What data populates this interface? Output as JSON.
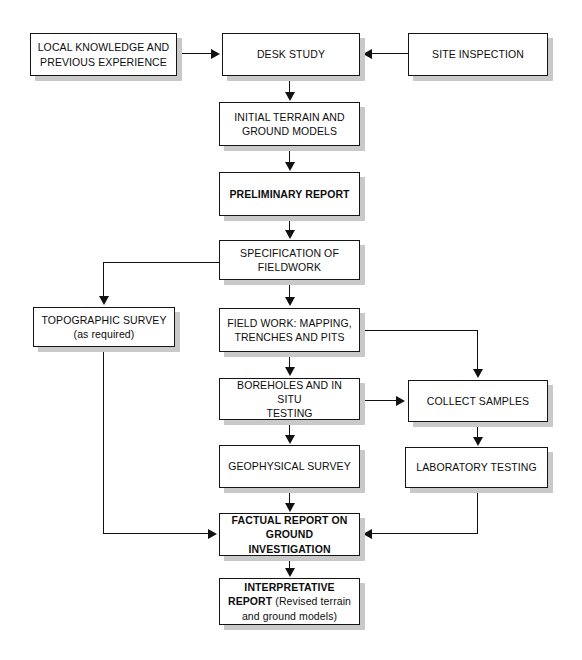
{
  "diagram": {
    "colors": {
      "box_fill": "#ffffff",
      "box_border": "#151515",
      "box_shadow": "#c9c9c9",
      "connector": "#111111",
      "background": "#ffffff"
    },
    "nodes": [
      {
        "id": "local-knowledge",
        "lines": [
          "LOCAL KNOWLEDGE AND",
          "PREVIOUS EXPERIENCE"
        ],
        "bold": false
      },
      {
        "id": "desk-study",
        "lines": [
          "DESK STUDY"
        ],
        "bold": false
      },
      {
        "id": "site-inspection",
        "lines": [
          "SITE INSPECTION"
        ],
        "bold": false
      },
      {
        "id": "initial-terrain",
        "lines": [
          "INITIAL TERRAIN AND",
          "GROUND MODELS"
        ],
        "bold": false
      },
      {
        "id": "preliminary-report",
        "lines": [
          "PRELIMINARY REPORT"
        ],
        "bold": true
      },
      {
        "id": "specification-fieldwork",
        "lines": [
          "SPECIFICATION OF",
          "FIELDWORK"
        ],
        "bold": false
      },
      {
        "id": "topographic-survey",
        "lines": [
          "TOPOGRAPHIC SURVEY",
          "(as required)"
        ],
        "bold": false
      },
      {
        "id": "field-work",
        "lines": [
          "FIELD WORK: MAPPING,",
          "TRENCHES AND PITS"
        ],
        "bold": false
      },
      {
        "id": "boreholes",
        "lines": [
          "BOREHOLES AND IN SITU",
          "TESTING"
        ],
        "bold": false
      },
      {
        "id": "collect-samples",
        "lines": [
          "COLLECT SAMPLES"
        ],
        "bold": false
      },
      {
        "id": "geophysical-survey",
        "lines": [
          "GEOPHYSICAL SURVEY"
        ],
        "bold": false
      },
      {
        "id": "laboratory-testing",
        "lines": [
          "LABORATORY TESTING"
        ],
        "bold": false
      },
      {
        "id": "factual-report",
        "lines": [
          "FACTUAL REPORT ON",
          "GROUND INVESTIGATION"
        ],
        "bold": true
      },
      {
        "id": "interpretative-report",
        "lines": [
          "INTERPRETATIVE",
          "REPORT (Revised terrain",
          "and ground models)"
        ],
        "bold": true
      }
    ],
    "node_text": {
      "local_knowledge_l1": "LOCAL KNOWLEDGE AND",
      "local_knowledge_l2": "PREVIOUS EXPERIENCE",
      "desk_study": "DESK STUDY",
      "site_inspection": "SITE INSPECTION",
      "initial_terrain_l1": "INITIAL TERRAIN AND",
      "initial_terrain_l2": "GROUND MODELS",
      "preliminary_report": "PRELIMINARY REPORT",
      "specification_l1": "SPECIFICATION OF",
      "specification_l2": "FIELDWORK",
      "topographic_l1": "TOPOGRAPHIC SURVEY",
      "topographic_l2": "(as required)",
      "field_work_l1": "FIELD WORK: MAPPING,",
      "field_work_l2": "TRENCHES AND PITS",
      "boreholes_l1": "BOREHOLES AND IN SITU",
      "boreholes_l2": "TESTING",
      "collect_samples": "COLLECT SAMPLES",
      "geophysical_survey": "GEOPHYSICAL SURVEY",
      "laboratory_testing": "LABORATORY TESTING",
      "factual_l1": "FACTUAL REPORT ON",
      "factual_l2": "GROUND INVESTIGATION",
      "interpretative_l1": "INTERPRETATIVE",
      "interpretative_l2_bold": "REPORT",
      "interpretative_l2_rest": " (Revised terrain",
      "interpretative_l3": "and ground models)"
    },
    "edges": [
      {
        "from": "local-knowledge",
        "to": "desk-study",
        "direction": "right"
      },
      {
        "from": "site-inspection",
        "to": "desk-study",
        "direction": "left"
      },
      {
        "from": "desk-study",
        "to": "initial-terrain",
        "direction": "down"
      },
      {
        "from": "initial-terrain",
        "to": "preliminary-report",
        "direction": "down"
      },
      {
        "from": "preliminary-report",
        "to": "specification-fieldwork",
        "direction": "down"
      },
      {
        "from": "specification-fieldwork",
        "to": "topographic-survey",
        "direction": "down-left"
      },
      {
        "from": "specification-fieldwork",
        "to": "field-work",
        "direction": "down"
      },
      {
        "from": "field-work",
        "to": "boreholes",
        "direction": "down"
      },
      {
        "from": "field-work",
        "to": "collect-samples",
        "direction": "right-down"
      },
      {
        "from": "boreholes",
        "to": "collect-samples",
        "direction": "right"
      },
      {
        "from": "boreholes",
        "to": "geophysical-survey",
        "direction": "down"
      },
      {
        "from": "collect-samples",
        "to": "laboratory-testing",
        "direction": "down"
      },
      {
        "from": "geophysical-survey",
        "to": "factual-report",
        "direction": "down"
      },
      {
        "from": "topographic-survey",
        "to": "factual-report",
        "direction": "down-right"
      },
      {
        "from": "laboratory-testing",
        "to": "factual-report",
        "direction": "down-left"
      },
      {
        "from": "factual-report",
        "to": "interpretative-report",
        "direction": "down"
      }
    ]
  }
}
